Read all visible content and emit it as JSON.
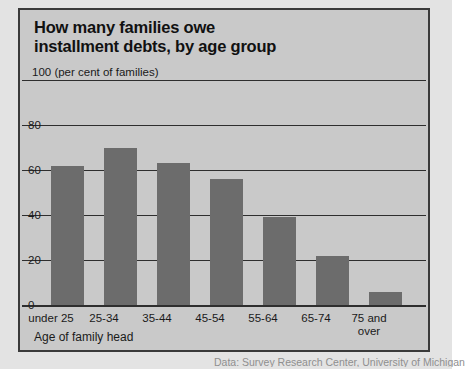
{
  "chart_data": {
    "type": "bar",
    "title": "How many families owe installment debts, by age group",
    "title_lines": [
      "How many families owe",
      "installment debts, by age group"
    ],
    "unit_caption": "100 (per cent of families)",
    "xlabel": "Age of family head",
    "ylabel": "per cent of families",
    "categories": [
      "under 25",
      "25-34",
      "35-44",
      "45-54",
      "55-64",
      "65-74",
      "75 and over"
    ],
    "category_lines": [
      [
        "under 25"
      ],
      [
        "25-34"
      ],
      [
        "35-44"
      ],
      [
        "45-54"
      ],
      [
        "55-64"
      ],
      [
        "65-74"
      ],
      [
        "75 and",
        "over"
      ]
    ],
    "values": [
      62,
      70,
      63,
      56,
      39,
      22,
      6
    ],
    "ylim": [
      0,
      100
    ],
    "yticks": [
      100,
      80,
      60,
      40,
      20,
      0
    ],
    "ytick_labels": [
      "100",
      "80",
      "60",
      "40",
      "20",
      "0"
    ],
    "grid": true,
    "legend": "none",
    "source": "Data: Survey Research Center, University of Michigan",
    "colors": {
      "bar": "#6c6c6c",
      "plot_background": "#c9c9c9",
      "page_background": "#e3e3e3",
      "gridline": "#2e2e2e",
      "frame": "#3a3a3a",
      "text": "#1a1a1a",
      "source_text": "#8f8f8f"
    }
  }
}
